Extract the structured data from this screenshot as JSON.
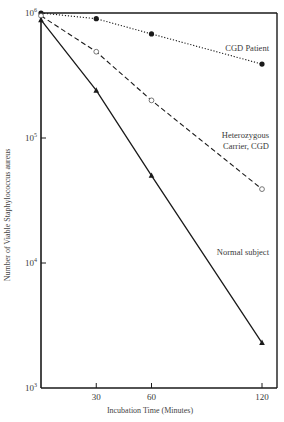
{
  "chart_data": {
    "type": "line",
    "title": "",
    "xlabel": "Incubation Time (Minutes)",
    "ylabel": "Number of Viable Staphylococcus aureus",
    "yscale": "log",
    "ylim": [
      1000,
      1000000
    ],
    "xlim": [
      0,
      125
    ],
    "x_ticks": [
      30,
      60,
      120
    ],
    "y_ticks": [
      {
        "base": "10",
        "exp": "6",
        "value": 1000000
      },
      {
        "base": "10",
        "exp": "5",
        "value": 100000
      },
      {
        "base": "10",
        "exp": "4",
        "value": 10000
      },
      {
        "base": "10",
        "exp": "3",
        "value": 1000
      }
    ],
    "grid": false,
    "legend": "inline labels",
    "x": [
      0,
      30,
      60,
      120
    ],
    "series": [
      {
        "name": "CGD Patient",
        "label_lines": [
          "CGD Patient"
        ],
        "marker": "filled-circle",
        "line": "dotted",
        "values": [
          1000000,
          900000,
          680000,
          390000
        ]
      },
      {
        "name": "Heterozygous Carrier, CGD",
        "label_lines": [
          "Heterozygous",
          "Carrier, CGD"
        ],
        "marker": "open-circle",
        "line": "dashed",
        "values": [
          950000,
          490000,
          200000,
          39000
        ]
      },
      {
        "name": "Normal subject",
        "label_lines": [
          "Normal subject"
        ],
        "marker": "filled-triangle",
        "line": "solid",
        "values": [
          880000,
          240000,
          50000,
          2300
        ]
      }
    ]
  },
  "colors": {
    "ink": "#1a1a1a",
    "label": "#3a3a3a",
    "background": "#ffffff"
  }
}
